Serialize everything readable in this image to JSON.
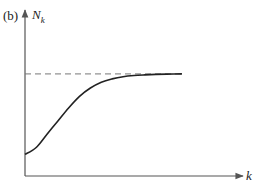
{
  "chart_data": {
    "type": "line",
    "title": "",
    "panel_label": "(b)",
    "xlabel": "k",
    "ylabel": "N",
    "ylabel_subscript": "k",
    "xlim": [
      0,
      1
    ],
    "ylim": [
      0,
      1
    ],
    "grid": false,
    "legend": "none",
    "ticks": {
      "x": [],
      "y": []
    },
    "asymptote": {
      "y": 0.615,
      "style": "dashed",
      "x_end": 0.72
    },
    "series": [
      {
        "name": "N_k",
        "style": "solid",
        "x": [
          0.0,
          0.05,
          0.1,
          0.15,
          0.2,
          0.25,
          0.3,
          0.35,
          0.4,
          0.45,
          0.5,
          0.55,
          0.6,
          0.65,
          0.72
        ],
        "y": [
          0.13,
          0.17,
          0.25,
          0.33,
          0.41,
          0.48,
          0.53,
          0.565,
          0.585,
          0.598,
          0.605,
          0.609,
          0.612,
          0.614,
          0.615
        ]
      }
    ]
  },
  "colors": {
    "axis": "#555555",
    "curve": "#222222",
    "asymptote": "#777777"
  }
}
